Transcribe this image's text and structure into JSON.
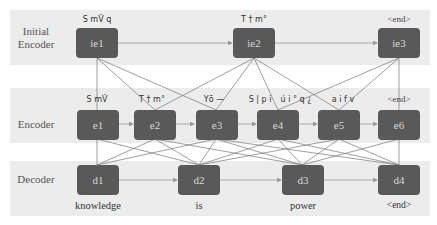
{
  "rows": {
    "initial_encoder": {
      "label": "Initial\nEncoder",
      "label_line1": "Initial",
      "label_line2": "Encoder"
    },
    "encoder": {
      "label": "Encoder"
    },
    "decoder": {
      "label": "Decoder"
    }
  },
  "initial_encoder_nodes": [
    {
      "id": "ie1",
      "top_label": "S mV̌ q"
    },
    {
      "id": "ie2",
      "top_label": "T † m°"
    },
    {
      "id": "ie3",
      "top_label": "<end>"
    }
  ],
  "encoder_nodes": [
    {
      "id": "e1",
      "top_label": "S mV̌"
    },
    {
      "id": "e2",
      "top_label": "T † m°"
    },
    {
      "id": "e3",
      "top_label": "Yō —"
    },
    {
      "id": "e4",
      "top_label": "S | p i"
    },
    {
      "id": "e5",
      "top_label": "a i f v"
    },
    {
      "id": "e6",
      "top_label": "<end>"
    }
  ],
  "encoder_extra_label": "ú i ° q ¿",
  "decoder_nodes": [
    {
      "id": "d1",
      "word": "knowledge"
    },
    {
      "id": "d2",
      "word": "is"
    },
    {
      "id": "d3",
      "word": "power"
    },
    {
      "id": "d4",
      "word": "<end>"
    }
  ],
  "connections": {
    "ie_to_e": [
      [
        "ie1",
        "e1"
      ],
      [
        "ie1",
        "e2"
      ],
      [
        "ie1",
        "e3"
      ],
      [
        "ie2",
        "e2"
      ],
      [
        "ie2",
        "e3"
      ],
      [
        "ie2",
        "e4"
      ],
      [
        "ie2",
        "e5"
      ],
      [
        "ie3",
        "e4"
      ],
      [
        "ie3",
        "e5"
      ],
      [
        "ie3",
        "e6"
      ]
    ],
    "e_to_d": "each decoder node connects to multiple encoder nodes",
    "sequential": [
      "ie1→ie2→ie3",
      "e1→e2→e3→e4→e5→e6",
      "d1→d2→d3→d4"
    ]
  },
  "colors": {
    "band": "#ececec",
    "node": "#595959",
    "node_text": "#d8d8d8",
    "edge": "#777777",
    "arrow": "#999999"
  }
}
